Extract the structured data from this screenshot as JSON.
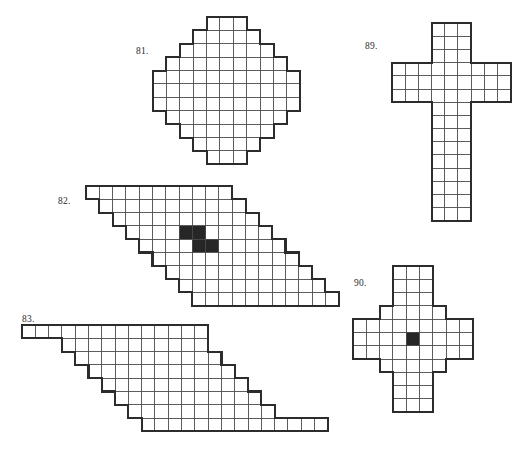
{
  "page": {
    "width": 525,
    "height": 449,
    "background": "#ffffff",
    "ink_color": "#2c2c2c",
    "grid_line_color": "#4a4a4a",
    "filled_cell_color": "#262626"
  },
  "figures": [
    {
      "id": "figure-81",
      "label": "81.",
      "label_x": 136,
      "label_y": 46,
      "origin_x": 153,
      "origin_y": 17,
      "cell": 13.4,
      "shape": "octagonal-diamond",
      "rows": [
        {
          "start": 4,
          "count": 3
        },
        {
          "start": 3,
          "count": 5
        },
        {
          "start": 2,
          "count": 7
        },
        {
          "start": 1,
          "count": 9
        },
        {
          "start": 0,
          "count": 11
        },
        {
          "start": 0,
          "count": 11
        },
        {
          "start": 0,
          "count": 11
        },
        {
          "start": 1,
          "count": 9
        },
        {
          "start": 2,
          "count": 7
        },
        {
          "start": 3,
          "count": 5
        },
        {
          "start": 4,
          "count": 3
        }
      ],
      "filled": []
    },
    {
      "id": "figure-82",
      "label": "82.",
      "label_x": 58,
      "label_y": 196,
      "origin_x": 86,
      "origin_y": 186,
      "cell": 13.3,
      "shape": "stepped-parallelogram",
      "rows": [
        {
          "start": 0,
          "count": 11
        },
        {
          "start": 1,
          "count": 11
        },
        {
          "start": 2,
          "count": 11
        },
        {
          "start": 3,
          "count": 11
        },
        {
          "start": 4,
          "count": 11
        },
        {
          "start": 5,
          "count": 11
        },
        {
          "start": 6,
          "count": 11
        },
        {
          "start": 7,
          "count": 11
        },
        {
          "start": 8,
          "count": 11
        }
      ],
      "filled": [
        {
          "row": 3,
          "col": 7
        },
        {
          "row": 3,
          "col": 8
        },
        {
          "row": 4,
          "col": 8
        },
        {
          "row": 4,
          "col": 9
        }
      ]
    },
    {
      "id": "figure-83",
      "label": "83.",
      "label_x": 22,
      "label_y": 314,
      "origin_x": 22,
      "origin_y": 325,
      "cell": 13.3,
      "shape": "stepped-parallelogram-with-tails",
      "rows": [
        {
          "start": 0,
          "count": 14
        },
        {
          "start": 3,
          "count": 11
        },
        {
          "start": 4,
          "count": 11
        },
        {
          "start": 5,
          "count": 11
        },
        {
          "start": 6,
          "count": 11
        },
        {
          "start": 7,
          "count": 11
        },
        {
          "start": 8,
          "count": 11
        },
        {
          "start": 9,
          "count": 14
        }
      ],
      "filled": []
    },
    {
      "id": "figure-89",
      "label": "89.",
      "label_x": 365,
      "label_y": 41,
      "origin_x": 392,
      "origin_y": 23,
      "cell": 13.2,
      "shape": "latin-cross",
      "rows": [
        {
          "start": 3,
          "count": 3
        },
        {
          "start": 3,
          "count": 3
        },
        {
          "start": 3,
          "count": 3
        },
        {
          "start": 0,
          "count": 9
        },
        {
          "start": 0,
          "count": 9
        },
        {
          "start": 0,
          "count": 9
        },
        {
          "start": 3,
          "count": 3
        },
        {
          "start": 3,
          "count": 3
        },
        {
          "start": 3,
          "count": 3
        },
        {
          "start": 3,
          "count": 3
        },
        {
          "start": 3,
          "count": 3
        },
        {
          "start": 3,
          "count": 3
        },
        {
          "start": 3,
          "count": 3
        },
        {
          "start": 3,
          "count": 3
        },
        {
          "start": 3,
          "count": 3
        }
      ],
      "filled": []
    },
    {
      "id": "figure-90",
      "label": "90.",
      "label_x": 354,
      "label_y": 278,
      "origin_x": 353,
      "origin_y": 266,
      "cell": 13.3,
      "shape": "stepped-greek-cross",
      "rows": [
        {
          "start": 3,
          "count": 3
        },
        {
          "start": 3,
          "count": 3
        },
        {
          "start": 3,
          "count": 3
        },
        {
          "start": 2,
          "count": 5
        },
        {
          "start": 0,
          "count": 9
        },
        {
          "start": 0,
          "count": 9
        },
        {
          "start": 0,
          "count": 9
        },
        {
          "start": 2,
          "count": 5
        },
        {
          "start": 3,
          "count": 3
        },
        {
          "start": 3,
          "count": 3
        },
        {
          "start": 3,
          "count": 3
        }
      ],
      "filled": [
        {
          "row": 5,
          "col": 4
        }
      ]
    }
  ]
}
